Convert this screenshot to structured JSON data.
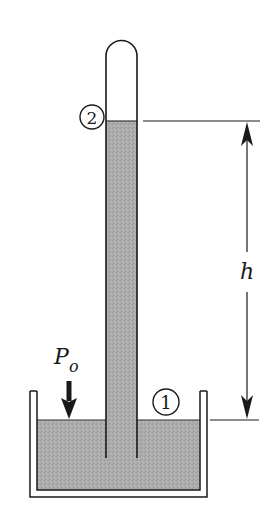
{
  "diagram": {
    "labels": {
      "point_top": "2",
      "point_bottom": "1",
      "height": "h",
      "pressure_main": "P",
      "pressure_sub": "o"
    },
    "colors": {
      "line": "#1a1a1a",
      "liquid": "#a9a9a9",
      "background": "#ffffff"
    }
  }
}
